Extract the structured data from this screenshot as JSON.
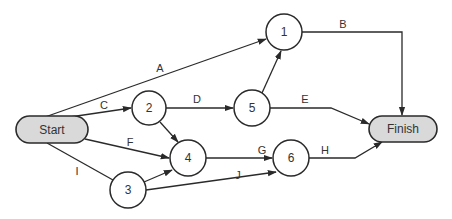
{
  "title": "",
  "nodes": [
    {
      "id": "start",
      "label": "Start",
      "type": "terminal"
    },
    {
      "id": "finish",
      "label": "Finish",
      "type": "terminal"
    },
    {
      "id": "n1",
      "label": "1",
      "type": "event"
    },
    {
      "id": "n2",
      "label": "2",
      "type": "event"
    },
    {
      "id": "n3",
      "label": "3",
      "type": "event"
    },
    {
      "id": "n4",
      "label": "4",
      "type": "event"
    },
    {
      "id": "n5",
      "label": "5",
      "type": "event"
    },
    {
      "id": "n6",
      "label": "6",
      "type": "event"
    }
  ],
  "edges": [
    {
      "id": "A",
      "label": "A",
      "from": "start",
      "to": "n1"
    },
    {
      "id": "B",
      "label": "B",
      "from": "n1",
      "to": "finish"
    },
    {
      "id": "C",
      "label": "C",
      "from": "start",
      "to": "n2"
    },
    {
      "id": "D",
      "label": "D",
      "from": "n2",
      "to": "n5"
    },
    {
      "id": "E",
      "label": "E",
      "from": "n5",
      "to": "finish"
    },
    {
      "id": "F",
      "label": "F",
      "from": "start",
      "to": "n4"
    },
    {
      "id": "G",
      "label": "G",
      "from": "n4",
      "to": "n6"
    },
    {
      "id": "H",
      "label": "H",
      "from": "n6",
      "to": "finish"
    },
    {
      "id": "I",
      "label": "I",
      "from": "start",
      "to": "n3"
    },
    {
      "id": "J",
      "label": "J",
      "from": "n3",
      "to": "n6"
    },
    {
      "id": "n2-n4",
      "label": "",
      "from": "n2",
      "to": "n4"
    },
    {
      "id": "n3-n4",
      "label": "",
      "from": "n3",
      "to": "n4"
    },
    {
      "id": "n5-n1",
      "label": "",
      "from": "n5",
      "to": "n1"
    }
  ],
  "colors": {
    "terminal_fill": "#d9d9d9",
    "stroke": "#2a2a2a",
    "background": "#ffffff"
  }
}
